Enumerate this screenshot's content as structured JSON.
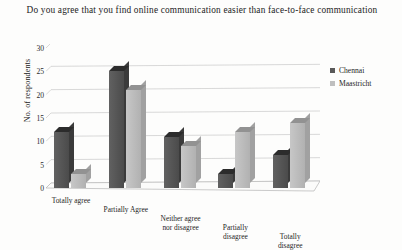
{
  "chart_data": {
    "type": "bar",
    "title": "Do you agree that you find online communication easier than face-to-face communication",
    "xlabel": "",
    "ylabel": "No. of respondents",
    "ylim": [
      0,
      30
    ],
    "ytick_step": 5,
    "yticks": [
      "30",
      "25",
      "20",
      "15",
      "10",
      "5",
      "0"
    ],
    "grid": true,
    "legend_position": "right",
    "style": "3d-clustered-column",
    "categories": [
      "Totally agree",
      "Partially Agree",
      "Neither agree nor disagree",
      "Partially disagree",
      "Totally disagree"
    ],
    "series": [
      {
        "name": "Chennai",
        "color": "#595959",
        "values": [
          12,
          25,
          11,
          3,
          7
        ]
      },
      {
        "name": "Maastricht",
        "color": "#bfbfbf",
        "values": [
          3,
          21,
          9,
          12,
          14
        ]
      }
    ]
  },
  "legend": {
    "items": [
      {
        "label": "Chennai",
        "color": "#595959"
      },
      {
        "label": "Maastricht",
        "color": "#bfbfbf"
      }
    ]
  }
}
